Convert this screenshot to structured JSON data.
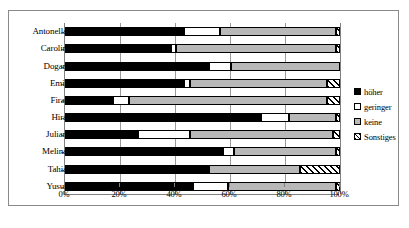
{
  "chart_data": {
    "type": "bar",
    "subtype": "stacked-horizontal-100pct",
    "title": "",
    "xlabel": "",
    "ylabel": "",
    "xlim": [
      0,
      100
    ],
    "grid": true,
    "legend_position": "right",
    "xticks": [
      "0%",
      "20%",
      "40%",
      "60%",
      "80%",
      "100%"
    ],
    "xtick_values": [
      0,
      20,
      40,
      60,
      80,
      100
    ],
    "categories": [
      "Antonella",
      "Carolin",
      "Dogan",
      "Emil",
      "Firat",
      "Hira",
      "Julian",
      "Melina",
      "Tahia",
      "Yusuf"
    ],
    "series": [
      {
        "name": "höher",
        "color": "#000000",
        "values": [
          43,
          38,
          52,
          43,
          17,
          71,
          26,
          57,
          52,
          46
        ]
      },
      {
        "name": "geringer",
        "color": "#ffffff",
        "values": [
          13,
          2,
          8,
          2,
          6,
          10,
          19,
          4,
          0,
          13
        ]
      },
      {
        "name": "keine",
        "color": "#b8b8b8",
        "values": [
          42,
          58,
          40,
          50,
          72,
          17,
          52,
          37,
          33,
          39
        ]
      },
      {
        "name": "Sonstiges",
        "color": "hatched",
        "values": [
          2,
          2,
          0,
          5,
          5,
          2,
          3,
          2,
          15,
          2
        ]
      }
    ]
  },
  "legend": {
    "items": [
      {
        "label": "höher"
      },
      {
        "label": "geringer"
      },
      {
        "label": "keine"
      },
      {
        "label": "Sonstiges"
      }
    ]
  }
}
